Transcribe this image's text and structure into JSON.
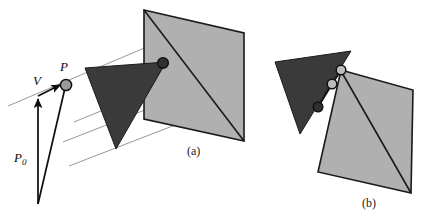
{
  "figure": {
    "background_color": "#ffffff",
    "width": 433,
    "height": 219
  },
  "colors": {
    "plane_fill": "#b0b0b0",
    "plane_stroke": "#1a1a1a",
    "triangle_fill": "#3a3a3a",
    "triangle_stroke": "#1a1a1a",
    "guide_line": "#8c8c8c",
    "ray_stroke": "#0c0c0c",
    "point_dark_fill": "#303030",
    "point_light_fill": "#9a9a9a",
    "point_open_fill": "#bdbdbd",
    "point_stroke": "#101010",
    "text_color": "#0c0c0c"
  },
  "labels": {
    "point_p": "P",
    "vector_v": "V",
    "point_p0_base": "P",
    "point_p0_subscript": "0"
  },
  "captions": {
    "panel_a": "(a)",
    "panel_b": "(b)"
  },
  "panel_a": {
    "name": "ray intersecting a plane through a triangle",
    "plane_polygon": "144,10 244,33 244,141 144,119",
    "plane_diagonal": "144,10 244,141",
    "triangle_polygon": "85,68 166,62 116,149",
    "intersection_point": {
      "cx": 163,
      "cy": 63,
      "r": 5.4
    },
    "guide_lines": [
      "8,106 196,26",
      "74,122 182,78",
      "63,142 201,88",
      "69,165 214,110"
    ],
    "ray_origin": {
      "x": 38,
      "y": 204
    },
    "ray_tip": {
      "x": 66,
      "y": 85
    },
    "vector_v_from": {
      "x": 38,
      "y": 96
    },
    "vector_v_to": {
      "x": 63,
      "y": 83
    },
    "point_p": {
      "cx": 66,
      "cy": 85,
      "r": 5.6
    },
    "label_p_pos": {
      "x": 60,
      "y": 71
    },
    "label_v_pos": {
      "x": 34,
      "y": 85
    },
    "label_p0_pos": {
      "x": 14,
      "y": 162
    },
    "caption_pos": {
      "x": 187,
      "y": 155
    }
  },
  "panel_b": {
    "name": "clipped polygon with three intersection vertices",
    "plane_polygon": "341,70 413,90 411,193 318,172",
    "plane_diagonal": "341,71 411,193",
    "triangle_polygon": "275,62 351,51 300,134",
    "clip_polyline": "341,70 332,84 318,107",
    "vertices": [
      {
        "cx": 341,
        "cy": 70,
        "r": 4.8,
        "style": "light"
      },
      {
        "cx": 332,
        "cy": 84,
        "r": 4.8,
        "style": "light"
      },
      {
        "cx": 318,
        "cy": 107,
        "r": 4.8,
        "style": "dark"
      }
    ],
    "caption_pos": {
      "x": 362,
      "y": 207
    }
  }
}
